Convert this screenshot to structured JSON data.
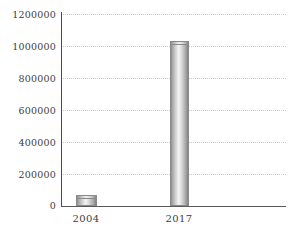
{
  "chart_data": {
    "type": "bar",
    "title": "",
    "subtitle": "",
    "xlabel": "",
    "ylabel": "",
    "categories": [
      "2004",
      "2017"
    ],
    "values": [
      70000,
      1030000
    ],
    "series": [
      {
        "name": "",
        "values": [
          70000,
          1030000
        ]
      }
    ],
    "ylim": [
      0,
      1200000
    ],
    "yticks": [
      0,
      200000,
      400000,
      600000,
      800000,
      1000000,
      1200000
    ],
    "ytick_labels": [
      "0",
      "200000",
      "400000",
      "600000",
      "800000",
      "1000000",
      "1200000"
    ],
    "xtick_labels": [
      "2004",
      "2017"
    ],
    "grid": true,
    "grid_axis": "y",
    "grid_style": "dotted",
    "legend": false,
    "legend_position": "none",
    "annotations": [],
    "colors": {
      "bar_light": "#f2f2f2",
      "bar_mid": "#c9c9c9",
      "bar_dark": "#808080",
      "bar_edge": "#8a8a8a",
      "gridline": "#c9c9c9",
      "axis": "#4a4a4a",
      "text": "#3d3d3d",
      "background": "#ffffff"
    }
  }
}
